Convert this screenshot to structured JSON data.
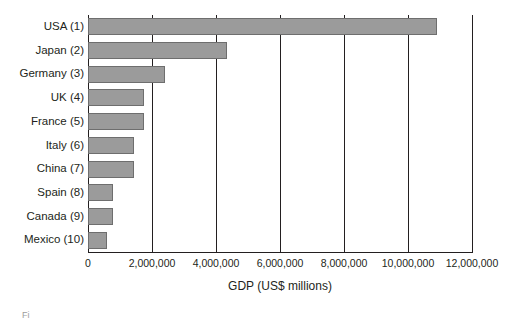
{
  "chart_data": {
    "type": "bar",
    "orientation": "horizontal",
    "title": "",
    "xlabel": "GDP (US$ millions)",
    "ylabel": "",
    "xlim": [
      0,
      12000000
    ],
    "xticks": [
      0,
      2000000,
      4000000,
      6000000,
      8000000,
      10000000,
      12000000
    ],
    "xtick_labels": [
      "0",
      "2,000,000",
      "4,000,000",
      "6,000,000",
      "8,000,000",
      "10,000,000",
      "12,000,000"
    ],
    "grid": "vertical",
    "legend": "none",
    "categories": [
      "USA (1)",
      "Japan (2)",
      "Germany (3)",
      "UK (4)",
      "France (5)",
      "Italy (6)",
      "China (7)",
      "Spain (8)",
      "Canada (9)",
      "Mexico (10)"
    ],
    "values": [
      10900000,
      4330000,
      2400000,
      1760000,
      1750000,
      1440000,
      1440000,
      770000,
      780000,
      580000
    ],
    "bar_color": "#9b9b9b",
    "bar_border_color": "#6e6e6e",
    "axis_color": "#231f20"
  },
  "caption": {
    "fragment": "Fi"
  }
}
